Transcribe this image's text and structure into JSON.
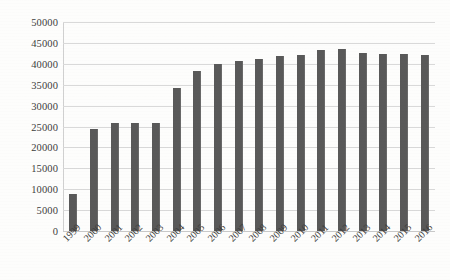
{
  "chart_data": {
    "type": "bar",
    "title": "",
    "subtitle": "",
    "xlabel": "",
    "ylabel": "",
    "ylim": [
      0,
      50000
    ],
    "ytick_step": 5000,
    "yticks": [
      "0",
      "5000",
      "10000",
      "15000",
      "20000",
      "25000",
      "30000",
      "35000",
      "40000",
      "45000",
      "50000"
    ],
    "grid": true,
    "legend": false,
    "legend_position": "none",
    "xtick_rotation": -45,
    "categories": [
      "1999",
      "2000",
      "2001",
      "2002",
      "2003",
      "2004",
      "2005",
      "2006",
      "2007",
      "2008",
      "2009",
      "2010",
      "2011",
      "2012",
      "2013",
      "2014",
      "2015",
      "2016"
    ],
    "values": [
      8900,
      24400,
      25900,
      25900,
      25900,
      34300,
      38300,
      40000,
      40700,
      41200,
      41800,
      42000,
      43400,
      43600,
      42700,
      42300,
      42300,
      42000
    ],
    "annotations": []
  },
  "style": {
    "bar_color": "#595959",
    "gridline_color": "#d9d9d9",
    "axis_color": "#d0d0d0",
    "text_color": "#3d3d3d",
    "background": "#fdfdfc"
  }
}
